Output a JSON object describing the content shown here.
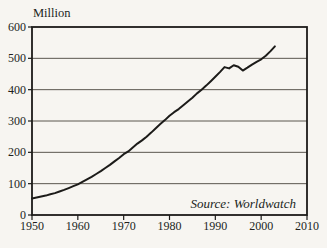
{
  "chart_data": {
    "type": "line",
    "unit_label": "Million",
    "source_note": "Source: Worldwatch",
    "xlabel": "",
    "ylabel": "Million",
    "xlim": [
      1950,
      2010
    ],
    "ylim": [
      0,
      600
    ],
    "xticks": [
      1950,
      1960,
      1970,
      1980,
      1990,
      2000,
      2010
    ],
    "yticks": [
      0,
      100,
      200,
      300,
      400,
      500,
      600
    ],
    "grid": "horizontal",
    "legend": "none",
    "colors": {
      "line": "#1c1b19",
      "grid": "#5b564f",
      "frame": "#1c1b19",
      "text": "#211f1c",
      "background": "#f7f5f1"
    },
    "points": [
      [
        1950,
        53
      ],
      [
        1951,
        56
      ],
      [
        1952,
        59
      ],
      [
        1953,
        62
      ],
      [
        1954,
        66
      ],
      [
        1955,
        70
      ],
      [
        1956,
        75
      ],
      [
        1957,
        80
      ],
      [
        1958,
        86
      ],
      [
        1959,
        92
      ],
      [
        1960,
        98
      ],
      [
        1961,
        106
      ],
      [
        1962,
        114
      ],
      [
        1963,
        122
      ],
      [
        1964,
        131
      ],
      [
        1965,
        140
      ],
      [
        1966,
        150
      ],
      [
        1967,
        160
      ],
      [
        1968,
        171
      ],
      [
        1969,
        182
      ],
      [
        1970,
        194
      ],
      [
        1971,
        203
      ],
      [
        1972,
        215
      ],
      [
        1973,
        228
      ],
      [
        1974,
        238
      ],
      [
        1975,
        250
      ],
      [
        1976,
        263
      ],
      [
        1977,
        277
      ],
      [
        1978,
        290
      ],
      [
        1979,
        303
      ],
      [
        1980,
        317
      ],
      [
        1981,
        328
      ],
      [
        1982,
        338
      ],
      [
        1983,
        350
      ],
      [
        1984,
        362
      ],
      [
        1985,
        374
      ],
      [
        1986,
        388
      ],
      [
        1987,
        400
      ],
      [
        1988,
        413
      ],
      [
        1989,
        427
      ],
      [
        1990,
        441
      ],
      [
        1991,
        456
      ],
      [
        1992,
        472
      ],
      [
        1993,
        468
      ],
      [
        1994,
        478
      ],
      [
        1995,
        473
      ],
      [
        1996,
        461
      ],
      [
        1997,
        470
      ],
      [
        1998,
        480
      ],
      [
        1999,
        489
      ],
      [
        2000,
        497
      ],
      [
        2001,
        508
      ],
      [
        2002,
        522
      ],
      [
        2003,
        538
      ]
    ]
  }
}
